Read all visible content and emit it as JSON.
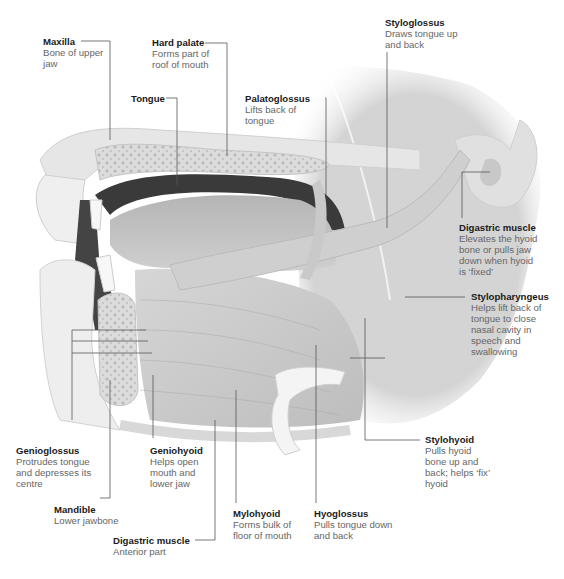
{
  "diagram": {
    "line_color": "#555555",
    "title_color": "#1a1a1a",
    "desc_color": "#666666"
  },
  "labels": {
    "maxilla": {
      "title": "Maxilla",
      "desc": "Bone of upper jaw"
    },
    "hard_palate": {
      "title": "Hard palate",
      "desc": "Forms part of roof of mouth"
    },
    "tongue": {
      "title": "Tongue",
      "desc": ""
    },
    "palatoglossus": {
      "title": "Palatoglossus",
      "desc": "Lifts back of tongue"
    },
    "styloglossus": {
      "title": "Styloglossus",
      "desc": "Draws tongue up and back"
    },
    "digastric_posterior": {
      "title": "Digastric muscle",
      "desc": "Elevates the hyoid bone or pulls jaw down when hyoid is ‘fixed’"
    },
    "stylopharyngeus": {
      "title": "Stylopharyngeus",
      "desc": "Helps lift back of tongue to close nasal cavity in speech and swallowing"
    },
    "stylohyoid": {
      "title": "Stylohyoid",
      "desc": "Pulls hyoid bone up and back; helps ‘fix’ hyoid"
    },
    "genioglossus": {
      "title": "Genioglossus",
      "desc": "Protrudes tongue and depresses its centre"
    },
    "geniohyoid": {
      "title": "Geniohyoid",
      "desc": "Helps open mouth and lower jaw"
    },
    "mandible": {
      "title": "Mandible",
      "desc": "Lower jawbone"
    },
    "mylohyoid": {
      "title": "Mylohyoid",
      "desc": "Forms bulk of floor of mouth"
    },
    "hyoglossus": {
      "title": "Hyoglossus",
      "desc": "Pulls tongue down and back"
    },
    "digastric_anterior": {
      "title": "Digastric muscle",
      "desc": "Anterior part"
    }
  }
}
